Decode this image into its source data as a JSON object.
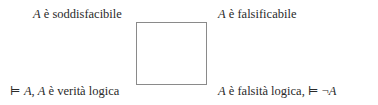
{
  "diagram": {
    "type": "square-of-opposition",
    "corners": {
      "top_left": {
        "var": "A",
        "text": " è soddisfacibile"
      },
      "top_right": {
        "var": "A",
        "text": " è falsificabile"
      },
      "bottom_left": {
        "prefix": "⊨ ",
        "var1": "A",
        "sep": ", ",
        "var2": "A",
        "text": " è verità logica"
      },
      "bottom_right": {
        "var": "A",
        "text": " è falsità logica, ",
        "suffix": "⊨ ¬",
        "var2": "A"
      }
    }
  }
}
